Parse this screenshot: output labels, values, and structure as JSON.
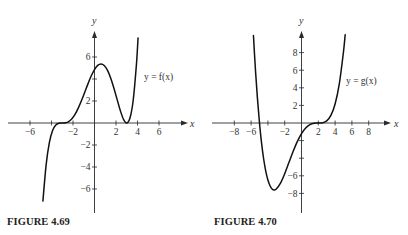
{
  "figures": [
    {
      "caption": "FIGURE 4.69",
      "curve_label": "y = f(x)",
      "x_axis_label": "x",
      "y_axis_label": "y"
    },
    {
      "caption": "FIGURE 4.70",
      "curve_label": "y = g(x)",
      "x_axis_label": "x",
      "y_axis_label": "y"
    }
  ],
  "chart_data": [
    {
      "type": "line",
      "title": "FIGURE 4.69",
      "xlabel": "x",
      "ylabel": "y",
      "legend": "y = f(x)",
      "grid": false,
      "x_ticks": [
        -6,
        -4,
        -2,
        2,
        4,
        6
      ],
      "x_tick_labels": [
        "−6",
        "",
        "−2",
        "2",
        "4",
        "6"
      ],
      "y_ticks": [
        -6,
        -4,
        -2,
        2,
        4,
        6
      ],
      "y_tick_labels": [
        "−6",
        "−4",
        "−2",
        "2",
        "",
        "6"
      ],
      "xlim": [
        -8,
        8.5
      ],
      "ylim": [
        -8,
        8.2
      ],
      "series": [
        {
          "name": "f(x)",
          "x": [
            -4.8,
            -4.5,
            -4.2,
            -3.9,
            -3.6,
            -3.3,
            -3.0,
            -2.7,
            -2.4,
            -2.1,
            -1.8,
            -1.5,
            -1.2,
            -0.9,
            -0.6,
            -0.3,
            0.0,
            0.3,
            0.6,
            0.9,
            1.2,
            1.5,
            1.8,
            2.1,
            2.4,
            2.7,
            3.0,
            3.3,
            3.6,
            3.9,
            4.05
          ],
          "y": [
            -7.1,
            -3.8,
            -1.79,
            -0.69,
            -0.19,
            -0.02,
            0,
            0.02,
            0.13,
            0.38,
            0.8,
            1.37,
            2.06,
            2.82,
            3.58,
            4.29,
            4.86,
            5.24,
            5.37,
            5.23,
            4.8,
            4.1,
            3.19,
            2.15,
            1.13,
            0.33,
            0,
            0.45,
            2.07,
            5.32,
            7.73
          ]
        }
      ]
    },
    {
      "type": "line",
      "title": "FIGURE 4.70",
      "xlabel": "x",
      "ylabel": "y",
      "legend": "y = g(x)",
      "grid": false,
      "x_ticks": [
        -8,
        -6,
        -4,
        -2,
        2,
        4,
        6,
        8
      ],
      "x_tick_labels": [
        "−8",
        "−6",
        "",
        "−2",
        "2",
        "4",
        "6",
        "8"
      ],
      "y_ticks": [
        -8,
        -6,
        -4,
        -2,
        2,
        4,
        6,
        8
      ],
      "y_tick_labels": [
        "−8",
        "−6",
        "",
        "",
        "2",
        "4",
        "6",
        "8"
      ],
      "xlim": [
        -8,
        10.5
      ],
      "ylim": [
        -10,
        10.2
      ],
      "series": [
        {
          "name": "g(x)",
          "x": [
            -5.72,
            -5.5,
            -5.25,
            -5.0,
            -4.75,
            -4.5,
            -4.25,
            -4.0,
            -3.75,
            -3.5,
            -3.25,
            -3.0,
            -2.5,
            -2.0,
            -1.5,
            -1.0,
            -0.5,
            0.0,
            0.5,
            1.0,
            1.5,
            2.0,
            2.5,
            3.0,
            3.5,
            4.0,
            4.5,
            5.0,
            5.2
          ],
          "y": [
            9.94,
            6.33,
            2.86,
            0,
            -2.31,
            -4.12,
            -5.49,
            -6.48,
            -7.13,
            -7.49,
            -7.6,
            -7.5,
            -6.83,
            -5.76,
            -4.5,
            -3.24,
            -2.11,
            -1.2,
            -0.56,
            -0.18,
            -0.02,
            0,
            0.03,
            0.24,
            0.86,
            2.16,
            4.45,
            8.1,
            10.03
          ]
        }
      ]
    }
  ]
}
